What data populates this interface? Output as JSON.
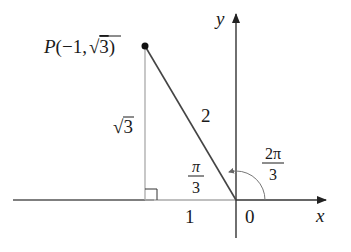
{
  "diagram": {
    "type": "unit-circle-angle",
    "point": {
      "label_name": "P",
      "label_open": "(",
      "label_x": "−1,",
      "label_sqrt_sign": "√",
      "label_y": "3",
      "label_close": ")",
      "x": "-1",
      "y": "√3"
    },
    "axes": {
      "x_label": "x",
      "y_label": "y",
      "origin_label": "0"
    },
    "segments": {
      "hypotenuse_label": "2",
      "vertical_leg_sqrt_sign": "√",
      "vertical_leg_value": "3",
      "horizontal_leg_label": "1"
    },
    "angles": {
      "reference_angle_num": "π",
      "reference_angle_den": "3",
      "standard_angle_num": "2π",
      "standard_angle_den": "3"
    },
    "colors": {
      "axis": "#333333",
      "hypotenuse": "#444444",
      "leg": "#aaaaaa",
      "text": "#1a1a1a"
    }
  }
}
